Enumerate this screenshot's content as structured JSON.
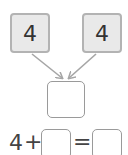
{
  "top_boxes": [
    {
      "value": "4"
    },
    {
      "value": "4"
    }
  ],
  "result_box": {
    "value": ""
  },
  "equation": {
    "left_operand": "4",
    "operator": "+",
    "blank_operand": "",
    "equals": "=",
    "blank_result": ""
  },
  "colors": {
    "box_fill": "#e9e9e9",
    "box_border": "#b3b3b3",
    "arrow": "#a6a6a6",
    "empty_border": "#9a9a9a"
  }
}
